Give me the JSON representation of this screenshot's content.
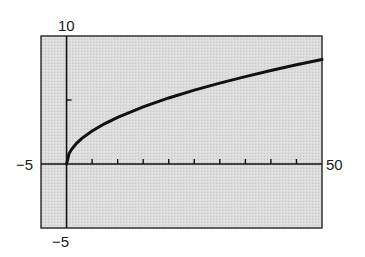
{
  "chart_data": {
    "type": "line",
    "title": "",
    "xlabel": "",
    "ylabel": "",
    "xlim": [
      -5,
      50
    ],
    "ylim": [
      -5,
      10
    ],
    "grid": false,
    "legend": null,
    "axis_labels": {
      "x_min": "−5",
      "x_max": "50",
      "y_min": "−5",
      "y_max": "10"
    },
    "x_ticks": [
      5,
      10,
      15,
      20,
      25,
      30,
      35,
      40,
      45
    ],
    "y_ticks": [
      5
    ],
    "series": [
      {
        "name": "curve",
        "x": [
          0,
          0.5,
          1,
          2,
          3,
          5,
          7.5,
          10,
          15,
          20,
          25,
          30,
          35,
          40,
          45,
          50
        ],
        "y": [
          0,
          0.82,
          1.15,
          1.63,
          2.0,
          2.58,
          3.16,
          3.65,
          4.47,
          5.16,
          5.77,
          6.32,
          6.83,
          7.3,
          7.75,
          8.16
        ]
      }
    ],
    "colors": {
      "background": "#d9d9d9",
      "line": "#111111",
      "frame": "#333333"
    }
  }
}
